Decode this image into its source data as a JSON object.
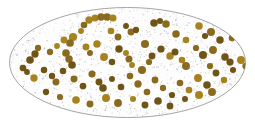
{
  "figure": {
    "type": "scientific-illustration",
    "name": "speckled-ellipse-field",
    "canvas": {
      "width": 255,
      "height": 126,
      "background": "#ffffff"
    },
    "ellipse": {
      "cx": 127.5,
      "cy": 62.5,
      "rx": 118,
      "ry": 55,
      "fill": "#fdfdfd",
      "stroke": "#8e8e90",
      "stroke_width": 0.8
    },
    "dots": {
      "color": "#8a6a1e",
      "color_light": "#a6831f",
      "color_dark": "#6f5416",
      "radius": 3.4,
      "count": 132
    },
    "speckle": {
      "colors": [
        "#9aa6c8",
        "#c9a9b8",
        "#c2b48a",
        "#b8c4d8",
        "#d8c2a0",
        "#8fa0c4",
        "#cfb0a0"
      ],
      "count": 1200,
      "radius": 0.5
    }
  },
  "chart_data": {
    "type": "scatter",
    "title": "",
    "xlabel": "",
    "ylabel": "",
    "xlim": [
      0,
      255
    ],
    "ylim": [
      0,
      126
    ],
    "grid": false,
    "legend": null,
    "series": [
      {
        "name": "particles",
        "color": "#8a6a1e",
        "marker": "circle",
        "size": 6.8,
        "points": [
          [
            89,
            20
          ],
          [
            95,
            18
          ],
          [
            101,
            17
          ],
          [
            107,
            17
          ],
          [
            113,
            18
          ],
          [
            84,
            25
          ],
          [
            81,
            31
          ],
          [
            73,
            37
          ],
          [
            70,
            43
          ],
          [
            111,
            31
          ],
          [
            126,
            26
          ],
          [
            131,
            32
          ],
          [
            136,
            30
          ],
          [
            154,
            23
          ],
          [
            160,
            21
          ],
          [
            166,
            24
          ],
          [
            176,
            34
          ],
          [
            186,
            40
          ],
          [
            199,
            26
          ],
          [
            205,
            36
          ],
          [
            211,
            32
          ],
          [
            220,
            40
          ],
          [
            232,
            38
          ],
          [
            38,
            48
          ],
          [
            35,
            54
          ],
          [
            50,
            52
          ],
          [
            57,
            46
          ],
          [
            66,
            53
          ],
          [
            69,
            59
          ],
          [
            72,
            65
          ],
          [
            86,
            47
          ],
          [
            90,
            53
          ],
          [
            97,
            44
          ],
          [
            104,
            57
          ],
          [
            112,
            62
          ],
          [
            119,
            49
          ],
          [
            126,
            53
          ],
          [
            129,
            59
          ],
          [
            132,
            65
          ],
          [
            145,
            44
          ],
          [
            152,
            56
          ],
          [
            149,
            62
          ],
          [
            161,
            49
          ],
          [
            170,
            56
          ],
          [
            175,
            52
          ],
          [
            182,
            60
          ],
          [
            186,
            66
          ],
          [
            196,
            48
          ],
          [
            203,
            55
          ],
          [
            213,
            50
          ],
          [
            225,
            57
          ],
          [
            230,
            62
          ],
          [
            241,
            60
          ],
          [
            23,
            68
          ],
          [
            27,
            72
          ],
          [
            34,
            78
          ],
          [
            44,
            70
          ],
          [
            52,
            76
          ],
          [
            56,
            82
          ],
          [
            63,
            71
          ],
          [
            74,
            79
          ],
          [
            83,
            86
          ],
          [
            92,
            74
          ],
          [
            99,
            82
          ],
          [
            103,
            88
          ],
          [
            112,
            79
          ],
          [
            121,
            87
          ],
          [
            130,
            76
          ],
          [
            138,
            84
          ],
          [
            147,
            92
          ],
          [
            155,
            80
          ],
          [
            163,
            88
          ],
          [
            172,
            95
          ],
          [
            180,
            83
          ],
          [
            189,
            90
          ],
          [
            198,
            78
          ],
          [
            207,
            85
          ],
          [
            216,
            73
          ],
          [
            224,
            80
          ],
          [
            233,
            70
          ],
          [
            46,
            92
          ],
          [
            60,
            97
          ],
          [
            76,
            100
          ],
          [
            90,
            104
          ],
          [
            106,
            98
          ],
          [
            118,
            103
          ],
          [
            133,
            99
          ],
          [
            145,
            105
          ],
          [
            158,
            101
          ],
          [
            170,
            106
          ],
          [
            185,
            99
          ],
          [
            199,
            95
          ],
          [
            212,
            92
          ],
          [
            64,
            40
          ],
          [
            118,
            37
          ],
          [
            142,
            70
          ],
          [
            210,
            66
          ],
          [
            30,
            60
          ],
          [
            246,
            66
          ]
        ]
      }
    ]
  }
}
